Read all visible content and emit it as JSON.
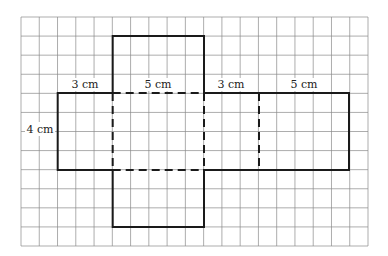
{
  "diagram": {
    "grid": {
      "columns": 19,
      "rows": 12
    },
    "labels": {
      "left_height": "4 cm",
      "seg1": "3 cm",
      "seg2": "5 cm",
      "seg3": "3 cm",
      "seg4": "5 cm"
    },
    "colors": {
      "grid": "#8a8a8a",
      "outline": "#1a1a1a"
    }
  }
}
